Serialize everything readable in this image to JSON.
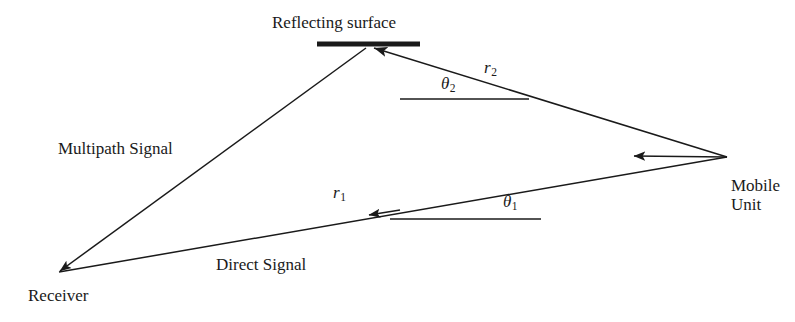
{
  "figure": {
    "kind": "geometry-diagram",
    "background_color": "#ffffff",
    "stroke_color": "#1a1a1a"
  },
  "labels": {
    "reflecting_surface": "Reflecting surface",
    "multipath_signal": "Multipath Signal",
    "direct_signal": "Direct Signal",
    "receiver": "Receiver",
    "mobile_unit_line1": "Mobile",
    "mobile_unit_line2": "Unit",
    "r1_base": "r",
    "r1_sub": "1",
    "r2_base": "r",
    "r2_sub": "2",
    "theta1_base": "θ",
    "theta1_sub": "1",
    "theta2_base": "θ",
    "theta2_sub": "2"
  },
  "geometry": {
    "reflection_point": {
      "x": 368,
      "y": 45
    },
    "receiver_point": {
      "x": 57,
      "y": 274
    },
    "mobile_unit_point": {
      "x": 727,
      "y": 157
    },
    "reflecting_surface_bar": {
      "x1": 317,
      "y1": 44,
      "x2": 420,
      "y2": 44,
      "thickness": 5
    },
    "theta2_reference_line": {
      "x1": 400,
      "y1": 99,
      "x2": 529,
      "y2": 99
    },
    "theta1_reference_line": {
      "x1": 390,
      "y1": 219,
      "x2": 541,
      "y2": 219
    },
    "mobile_unit_arrow": {
      "x1": 727,
      "y1": 157,
      "x2": 631,
      "y2": 156
    },
    "direct_signal_arrow_tip": {
      "x": 368,
      "y": 215
    },
    "incident_ray_arrow_tip": {
      "x": 368,
      "y": 46
    },
    "multipath_arrow_tip": {
      "x": 57,
      "y": 274
    }
  }
}
